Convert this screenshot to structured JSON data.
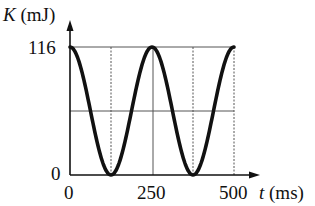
{
  "chart_data": {
    "type": "line",
    "title": "",
    "xlabel": "t (ms)",
    "ylabel": "K (mJ)",
    "x_ticks": [
      "0",
      "250",
      "500"
    ],
    "y_ticks": [
      "0",
      "116"
    ],
    "xlim": [
      0,
      500
    ],
    "ylim": [
      0,
      116
    ],
    "grid": true,
    "series": [
      {
        "name": "K",
        "x": [
          0,
          62.5,
          125,
          187.5,
          250,
          312.5,
          375,
          437.5,
          500
        ],
        "values": [
          116,
          58,
          0,
          58,
          116,
          58,
          0,
          58,
          116
        ]
      }
    ]
  },
  "labels": {
    "ylabel_var": "K",
    "ylabel_unit": " (mJ)",
    "xlabel_var": "t",
    "xlabel_unit": " (ms)",
    "y_top": "116",
    "y_zero": "0",
    "x0": "0",
    "x250": "250",
    "x500": "500"
  }
}
